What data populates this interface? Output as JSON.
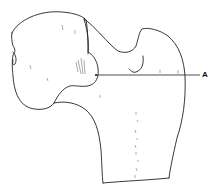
{
  "figure": {
    "labels": [
      {
        "id": "A",
        "text": "A",
        "x": 203,
        "y": 75
      }
    ],
    "colors": {
      "stroke": "#222222",
      "background": "#ffffff"
    }
  }
}
